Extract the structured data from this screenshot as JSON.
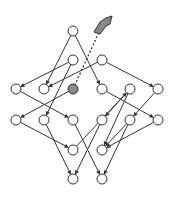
{
  "diagram": {
    "stroke": "#333333",
    "highlight": "#888888",
    "nodes": [
      {
        "id": "n1",
        "x": 73,
        "y": 31
      },
      {
        "id": "n2",
        "x": 73,
        "y": 60
      },
      {
        "id": "n3",
        "x": 102,
        "y": 60
      },
      {
        "id": "n4",
        "x": 16,
        "y": 89
      },
      {
        "id": "n5",
        "x": 44,
        "y": 89
      },
      {
        "id": "n6",
        "x": 73,
        "y": 89,
        "highlight": true
      },
      {
        "id": "n7",
        "x": 102,
        "y": 89
      },
      {
        "id": "n8",
        "x": 130,
        "y": 89
      },
      {
        "id": "n9",
        "x": 158,
        "y": 89
      },
      {
        "id": "n10",
        "x": 16,
        "y": 120
      },
      {
        "id": "n11",
        "x": 44,
        "y": 120
      },
      {
        "id": "n12",
        "x": 73,
        "y": 120
      },
      {
        "id": "n13",
        "x": 102,
        "y": 120
      },
      {
        "id": "n14",
        "x": 130,
        "y": 120
      },
      {
        "id": "n15",
        "x": 158,
        "y": 120
      },
      {
        "id": "n16",
        "x": 73,
        "y": 150
      },
      {
        "id": "n17",
        "x": 102,
        "y": 150
      },
      {
        "id": "n18",
        "x": 73,
        "y": 179
      },
      {
        "id": "n19",
        "x": 102,
        "y": 179
      }
    ],
    "edges": [
      [
        "n1",
        "n5"
      ],
      [
        "n1",
        "n7"
      ],
      [
        "n2",
        "n4"
      ],
      [
        "n2",
        "n11"
      ],
      [
        "n3",
        "n5"
      ],
      [
        "n3",
        "n9"
      ],
      [
        "n4",
        "n12"
      ],
      [
        "n6",
        "n10"
      ],
      [
        "n7",
        "n15"
      ],
      [
        "n8",
        "n13"
      ],
      [
        "n8",
        "n17"
      ],
      [
        "n9",
        "n14"
      ],
      [
        "n10",
        "n16"
      ],
      [
        "n11",
        "n18"
      ],
      [
        "n12",
        "n19"
      ],
      [
        "n13",
        "n18"
      ],
      [
        "n14",
        "n17"
      ],
      [
        "n14",
        "n19"
      ],
      [
        "n15",
        "n17"
      ],
      [
        "n16",
        "n8"
      ]
    ],
    "arrow": {
      "from": "n6",
      "to_x": 104,
      "to_y": 24,
      "dashed": true
    }
  }
}
